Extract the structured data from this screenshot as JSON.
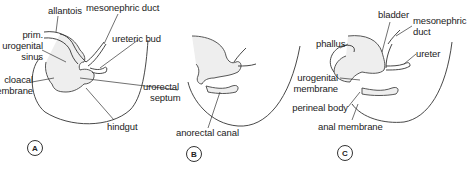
{
  "figure": {
    "panels": [
      {
        "id": "A",
        "labels": {
          "allantois": "allantois",
          "mesonephric_duct": "mesonephric duct",
          "prim_urogenital_sinus_1": "prim.",
          "prim_urogenital_sinus_2": "urogenital",
          "prim_urogenital_sinus_3": "sinus",
          "ureteric_bud": "ureteric bud",
          "cloacal_membrane_1": "cloacal",
          "cloacal_membrane_2": "membrane",
          "hindgut": "hindgut"
        }
      },
      {
        "id": "B",
        "labels": {
          "urorectal_septum_1": "urorectal",
          "urorectal_septum_2": "septum",
          "anorectal_canal": "anorectal canal"
        }
      },
      {
        "id": "C",
        "labels": {
          "bladder": "bladder",
          "mesonephric_duct_1": "mesonephric",
          "mesonephric_duct_2": "duct",
          "phallus": "phallus",
          "ureter": "ureter",
          "urogenital_membrane_1": "urogenital",
          "urogenital_membrane_2": "membrane",
          "perineal_body": "perineal body",
          "anal_membrane": "anal membrane"
        }
      }
    ]
  }
}
